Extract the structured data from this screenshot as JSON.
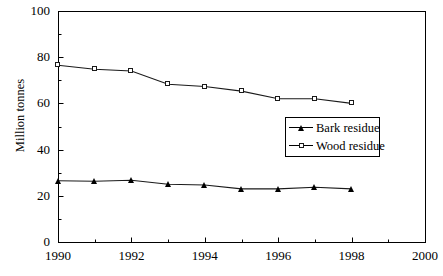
{
  "chart_data": {
    "type": "line",
    "title": "",
    "xlabel": "",
    "ylabel": "Million tonnes",
    "xlim": [
      1990,
      2000
    ],
    "ylim": [
      0,
      100
    ],
    "x_ticks": [
      1990,
      1992,
      1994,
      1996,
      1998,
      2000
    ],
    "x_tick_labels": [
      "1990",
      "1992",
      "1994",
      "1996",
      "1998",
      "2000"
    ],
    "x_minor_step": 1,
    "y_ticks": [
      0,
      20,
      40,
      60,
      80,
      100
    ],
    "y_tick_labels": [
      "0",
      "20",
      "40",
      "60",
      "80",
      "100"
    ],
    "y_minor_step": 10,
    "grid": false,
    "legend_position": "center-right",
    "x": [
      1990,
      1991,
      1992,
      1993,
      1994,
      1995,
      1996,
      1997,
      1998
    ],
    "series": [
      {
        "name": "Bark residue",
        "marker": "filled-triangle",
        "values": [
          26.5,
          26.3,
          26.7,
          25.0,
          24.7,
          23.0,
          23.0,
          23.7,
          23.0
        ]
      },
      {
        "name": "Wood residue",
        "marker": "open-square",
        "values": [
          76.5,
          74.8,
          74.0,
          68.3,
          67.3,
          65.3,
          62.0,
          62.0,
          60.0
        ]
      }
    ]
  },
  "legend": {
    "entries": [
      {
        "label": "Bark residue"
      },
      {
        "label": "Wood residue"
      }
    ]
  },
  "axes": {
    "y_title": "Million tonnes"
  }
}
